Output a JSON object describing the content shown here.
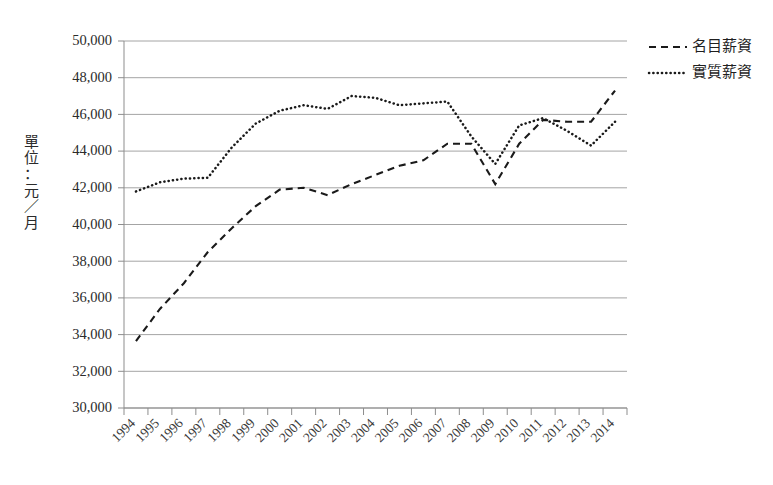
{
  "chart_data": {
    "type": "line",
    "title": "",
    "subtitle": "",
    "xlabel": "",
    "ylabel": "單位：元／月",
    "ylabel_chars": [
      "單",
      "位",
      "：",
      "元",
      "／",
      "月"
    ],
    "ylim": [
      30000,
      50000
    ],
    "ytick_step": 2000,
    "ytick_labels": [
      "30,000",
      "32,000",
      "34,000",
      "36,000",
      "38,000",
      "40,000",
      "42,000",
      "44,000",
      "46,000",
      "48,000",
      "50,000"
    ],
    "ytick_values": [
      30000,
      32000,
      34000,
      36000,
      38000,
      40000,
      42000,
      44000,
      46000,
      48000,
      50000
    ],
    "grid": true,
    "grid_axis": "y",
    "legend_position": "top-right",
    "categories": [
      "1994",
      "1995",
      "1996",
      "1997",
      "1998",
      "1999",
      "2000",
      "2001",
      "2002",
      "2003",
      "2004",
      "2005",
      "2006",
      "2007",
      "2008",
      "2009",
      "2010",
      "2011",
      "2012",
      "2013",
      "2014"
    ],
    "x": [
      1994,
      1995,
      1996,
      1997,
      1998,
      1999,
      2000,
      2001,
      2002,
      2003,
      2004,
      2005,
      2006,
      2007,
      2008,
      2009,
      2010,
      2011,
      2012,
      2013,
      2014
    ],
    "series": [
      {
        "name": "名目薪資",
        "style": "dashed",
        "color": "#1a1a1a",
        "values": [
          33650,
          35400,
          36800,
          38500,
          39800,
          41000,
          41900,
          42000,
          41600,
          42200,
          42700,
          43200,
          43500,
          44400,
          44400,
          42200,
          44400,
          45700,
          45600,
          45600,
          47300
        ]
      },
      {
        "name": "實質薪資",
        "style": "dotted",
        "color": "#1a1a1a",
        "values": [
          41800,
          42300,
          42500,
          42550,
          44200,
          45500,
          46200,
          46500,
          46300,
          47000,
          46900,
          46500,
          46600,
          46700,
          44800,
          43300,
          45400,
          45800,
          45100,
          44300,
          45600
        ]
      }
    ],
    "legend": [
      {
        "label": "名目薪資",
        "style": "dashed"
      },
      {
        "label": "實質薪資",
        "style": "dotted"
      }
    ]
  },
  "layout": {
    "plot_left": 124,
    "plot_right": 627,
    "plot_top": 41,
    "plot_bottom": 408
  }
}
